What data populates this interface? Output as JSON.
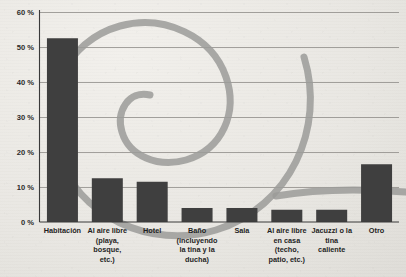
{
  "chart_data": {
    "type": "bar",
    "title": "",
    "subtitle": "",
    "xlabel": "",
    "ylabel": "",
    "ylim": [
      0,
      60
    ],
    "ytick_labels": [
      "0 %",
      "10 %",
      "20 %",
      "30 %",
      "40 %",
      "50 %",
      "60 %"
    ],
    "ytick_values": [
      0,
      10,
      20,
      30,
      40,
      50,
      60
    ],
    "grid": true,
    "legend": "none",
    "value_suffix": "%",
    "categories": [
      "Habitación",
      "Al aire libre (playa, bosque, etc.)",
      "Hotel",
      "Baño (incluyendo la tina y la ducha)",
      "Sala",
      "Al aire libre en casa (techo, patio, etc.)",
      "Jacuzzi o la tina caliente",
      "Otro"
    ],
    "category_lines": [
      [
        "Habitación"
      ],
      [
        "Al aire libre",
        "(playa,",
        "bosque,",
        "etc.)"
      ],
      [
        "Hotel"
      ],
      [
        "Baño",
        "(incluyendo",
        "la tina y la",
        "ducha)"
      ],
      [
        "Sala"
      ],
      [
        "Al aire libre",
        "en casa",
        "(techo,",
        "patio, etc.)"
      ],
      [
        "Jacuzzi o la",
        "tina",
        "caliente"
      ],
      [
        "Otro"
      ]
    ],
    "values": [
      52.5,
      12.5,
      11.5,
      4.0,
      4.0,
      3.5,
      3.5,
      16.5
    ],
    "colors": {
      "bar": "#3f3f3f",
      "gridline": "#8e8c88",
      "axis": "#3a3a3a",
      "background": "#eceae6",
      "decoration": "#9b9b99"
    },
    "decoration": "spiral-ribbon"
  }
}
